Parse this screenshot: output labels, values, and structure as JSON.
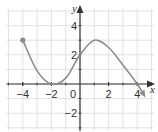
{
  "chart_data": {
    "type": "line",
    "title": "",
    "xlabel": "x",
    "ylabel": "y",
    "xlim": [
      -5,
      5
    ],
    "ylim": [
      -3,
      5
    ],
    "grid": true,
    "x_ticks": [
      -4,
      -2,
      0,
      2,
      4
    ],
    "y_ticks": [
      4,
      2,
      -2
    ],
    "x_tick_labels": [
      "−4",
      "−2",
      "0",
      "2",
      "4"
    ],
    "y_tick_labels": [
      "4",
      "2",
      "−2"
    ],
    "series": [
      {
        "name": "f(x)",
        "start_point": {
          "x": -4,
          "y": 3,
          "closed": true
        },
        "end": "arrow",
        "points": [
          {
            "x": -4,
            "y": 3
          },
          {
            "x": -3,
            "y": 0.9
          },
          {
            "x": -2,
            "y": 0
          },
          {
            "x": -1,
            "y": 0.4
          },
          {
            "x": 0,
            "y": 2
          },
          {
            "x": 1,
            "y": 3
          },
          {
            "x": 2,
            "y": 2.5
          },
          {
            "x": 3,
            "y": 1.3
          },
          {
            "x": 4,
            "y": 0
          },
          {
            "x": 4.5,
            "y": -0.8
          }
        ]
      }
    ],
    "colors": {
      "curve": "#8c8c8c",
      "axes": "#333333",
      "grid": "#d9d9d9"
    }
  }
}
